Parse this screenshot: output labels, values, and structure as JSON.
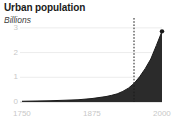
{
  "chart_data": {
    "type": "area",
    "title": "Urban population",
    "subtitle": "Billions",
    "xlabel": "",
    "ylabel": "Billions",
    "grid": true,
    "legend": false,
    "xlim": [
      1750,
      2000
    ],
    "ylim": [
      0,
      3.4
    ],
    "y_ticks": [
      "3",
      "2",
      "1",
      "0"
    ],
    "y_tick_values": [
      3,
      2,
      1,
      0
    ],
    "x_ticks": [
      "1750",
      "1875",
      "2000"
    ],
    "x_tick_values": [
      1750,
      1875,
      2000
    ],
    "series_name": "Urban population",
    "area_color": "#2b2b2b",
    "grid_color": "#e4e4e4",
    "tick_label_color": "#c8c8c8",
    "title_color": "#1a1a1a",
    "x": [
      1750,
      1775,
      1800,
      1825,
      1850,
      1875,
      1900,
      1910,
      1920,
      1930,
      1940,
      1950,
      1960,
      1970,
      1980,
      1990,
      2000
    ],
    "values": [
      0.03,
      0.04,
      0.05,
      0.07,
      0.09,
      0.14,
      0.22,
      0.27,
      0.33,
      0.43,
      0.56,
      0.75,
      1.02,
      1.35,
      1.74,
      2.29,
      2.86
    ],
    "annotations": [
      {
        "name": "reference-line",
        "type": "vline",
        "x": 1950,
        "style": "dashed",
        "color": "#1a1a1a"
      },
      {
        "name": "endpoint-marker",
        "type": "point",
        "x": 2000,
        "y": 2.86,
        "color": "#1a1a1a"
      }
    ]
  }
}
